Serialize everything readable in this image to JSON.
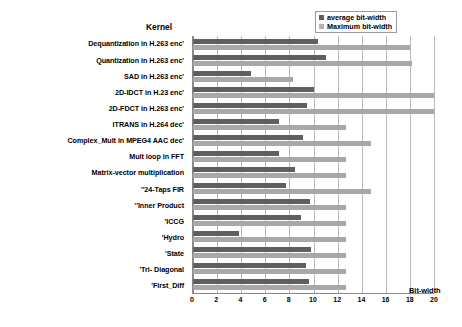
{
  "chart_data": {
    "type": "bar",
    "orientation": "horizontal",
    "title": "Kernel",
    "xlabel": "Bit-width",
    "ylabel": "Kernel",
    "xlim": [
      0,
      20
    ],
    "xticks": [
      0,
      2,
      4,
      6,
      8,
      10,
      12,
      14,
      16,
      18,
      20
    ],
    "grid": true,
    "legend_position": "top-right",
    "categories": [
      "Dequantization in H.263 enc'",
      "Quantization in H.263 enc'",
      "SAD in H.263 enc'",
      "2D-IDCT in H.23 enc'",
      "2D-FDCT in H.263 enc'",
      "ITRANS  in H.264 dec'",
      "Complex_Mult in MPEG4 AAC dec'",
      "Mult loop in FFT",
      "Matrix-vector multiplication",
      "''24-Taps FIR",
      "''Inner Product",
      "'ICCG",
      "'Hydro",
      "'State",
      "'Tri- Diagonal",
      "'First_Diff"
    ],
    "series": [
      {
        "name": "average bit-width",
        "color": "#5f5f5f",
        "values": [
          10.4,
          11.0,
          4.8,
          10.0,
          9.5,
          7.1,
          9.1,
          7.1,
          8.5,
          7.7,
          9.7,
          9.0,
          3.8,
          9.8,
          9.4,
          9.6
        ]
      },
      {
        "name": "Maximum bit-width",
        "color": "#a8a8a8",
        "values": [
          18.0,
          18.2,
          8.3,
          20.0,
          20.0,
          12.7,
          14.8,
          12.7,
          12.7,
          14.8,
          12.7,
          12.7,
          12.7,
          12.7,
          12.7,
          12.7
        ]
      }
    ]
  },
  "legend": {
    "items": [
      {
        "label": "average bit-width"
      },
      {
        "label": "Maximum bit-width"
      }
    ]
  }
}
